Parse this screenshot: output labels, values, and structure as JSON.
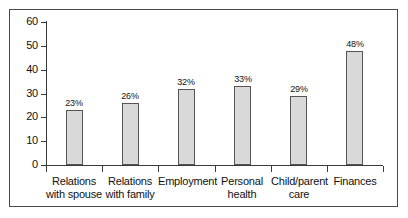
{
  "chart_data": {
    "type": "bar",
    "title": "",
    "subtitle": "",
    "xlabel": "",
    "ylabel": "",
    "ylim": [
      0,
      60
    ],
    "yticks": [
      0,
      10,
      20,
      30,
      40,
      50,
      60
    ],
    "ytick_labels": [
      "0",
      "10",
      "20",
      "30",
      "40",
      "50",
      "60"
    ],
    "grid": false,
    "legend": false,
    "legend_position": "none",
    "categories": [
      "Relations\nwith spouse",
      "Relations\nwith family",
      "Employment",
      "Personal\nhealth",
      "Child/parent\ncare",
      "Finances"
    ],
    "values": [
      23,
      26,
      32,
      33,
      29,
      48
    ],
    "data_labels": [
      "23%",
      "26%",
      "32%",
      "33%",
      "29%",
      "48%"
    ],
    "colors": {
      "bar_fill": "#d9d9d9",
      "bar_border": "#555555",
      "axis": "#3b3b3b",
      "frame": "#4a4a4a",
      "text": "#111111",
      "background": "#ffffff"
    }
  }
}
